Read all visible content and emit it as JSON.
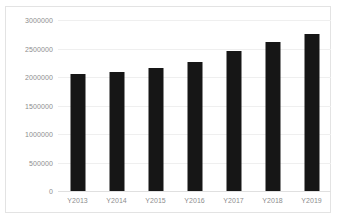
{
  "chart_data": {
    "type": "bar",
    "title": "",
    "xlabel": "",
    "ylabel": "",
    "categories": [
      "Y2013",
      "Y2014",
      "Y2015",
      "Y2016",
      "Y2017",
      "Y2018",
      "Y2019"
    ],
    "values": [
      2050000,
      2090000,
      2160000,
      2270000,
      2460000,
      2610000,
      2760000
    ],
    "ylim": [
      0,
      3000000
    ],
    "yticks": [
      0,
      500000,
      1000000,
      1500000,
      2000000,
      2500000,
      3000000
    ],
    "ytick_labels": [
      "0",
      "500000",
      "1000000",
      "1500000",
      "2000000",
      "2500000",
      "3000000"
    ],
    "grid": true,
    "legend": false,
    "legend_position": "none",
    "colors": {
      "bar": "#161616",
      "gridline": "#efefef",
      "axis_line": "#e0e0e0",
      "tick_label": "#8d8d8d",
      "border": "#e3e3e3",
      "background": "#ffffff"
    }
  }
}
